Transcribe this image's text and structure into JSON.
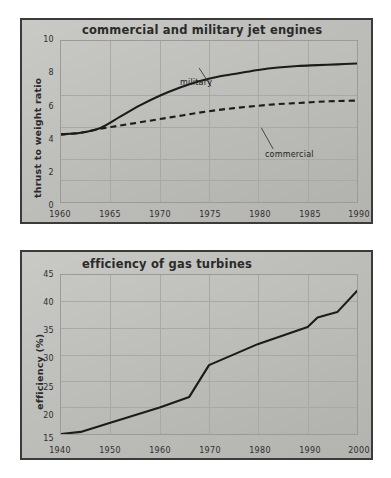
{
  "page": {
    "background_color": "#ffffff",
    "panel_color": "#c2c2bf",
    "border_color": "#3b3b3b",
    "line_color": "#1b1b1b",
    "grid_color": "#a8a8a5"
  },
  "chart_data": [
    {
      "type": "line",
      "title": "commercial and military jet engines",
      "xlabel": "",
      "ylabel": "thrust to weight ratio",
      "xlim": [
        1960,
        1990
      ],
      "ylim": [
        0,
        10
      ],
      "xticks": [
        "1960",
        "1965",
        "1970",
        "1975",
        "1980",
        "1985",
        "1990"
      ],
      "yticks": [
        "10",
        "8",
        "6",
        "4",
        "2",
        "0"
      ],
      "grid": true,
      "legend": "inline-annotations",
      "annotations": [
        {
          "text": "military",
          "x": 1968,
          "y": 8.6
        },
        {
          "text": "commercial",
          "x": 1980,
          "y": 4.6
        }
      ],
      "series": [
        {
          "name": "military",
          "style": "solid",
          "x": [
            1960,
            1962,
            1964,
            1966,
            1968,
            1970,
            1972,
            1974,
            1976,
            1978,
            1980,
            1982,
            1984,
            1986,
            1988,
            1990
          ],
          "values": [
            4.2,
            4.3,
            4.6,
            5.3,
            6.0,
            6.6,
            7.1,
            7.5,
            7.8,
            8.0,
            8.2,
            8.35,
            8.45,
            8.5,
            8.55,
            8.6
          ]
        },
        {
          "name": "commercial",
          "style": "dashed",
          "x": [
            1960,
            1962,
            1964,
            1966,
            1968,
            1970,
            1972,
            1974,
            1976,
            1978,
            1980,
            1982,
            1984,
            1986,
            1988,
            1990
          ],
          "values": [
            4.2,
            4.3,
            4.55,
            4.75,
            4.95,
            5.15,
            5.35,
            5.55,
            5.72,
            5.86,
            5.98,
            6.08,
            6.15,
            6.22,
            6.27,
            6.3
          ]
        }
      ]
    },
    {
      "type": "line",
      "title": "efficiency of gas turbines",
      "xlabel": "",
      "ylabel": "efficiency (%)",
      "xlim": [
        1940,
        2000
      ],
      "ylim": [
        15,
        45
      ],
      "xticks": [
        "1940",
        "1950",
        "1960",
        "1970",
        "1980",
        "1990",
        "2000"
      ],
      "yticks": [
        "45",
        "40",
        "35",
        "30",
        "25",
        "20",
        "15"
      ],
      "grid": true,
      "series": [
        {
          "name": "efficiency",
          "style": "solid",
          "x": [
            1940,
            1944,
            1950,
            1960,
            1966,
            1970,
            1980,
            1990,
            1992,
            1996,
            2000
          ],
          "values": [
            15.0,
            15.4,
            17.1,
            20.0,
            22.0,
            28.0,
            32.0,
            35.2,
            37.0,
            38.0,
            42.0
          ]
        }
      ]
    }
  ]
}
